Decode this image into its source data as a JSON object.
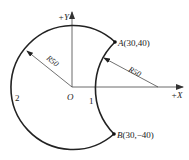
{
  "diagram": {
    "type": "arc-path",
    "axes": {
      "x_label": "+X",
      "y_label": "+Y",
      "origin_label": "O"
    },
    "points": {
      "A": {
        "label": "A(30,40)",
        "x": 30,
        "y": 40
      },
      "B": {
        "label": "B(30,−40)",
        "x": 30,
        "y": -40
      }
    },
    "arcs": [
      {
        "id": "1",
        "label": "1",
        "radius_label": "R50",
        "from": "A",
        "to": "B",
        "direction": "concave-inner"
      },
      {
        "id": "2",
        "label": "2",
        "radius_label": "R50",
        "from": "A",
        "to": "B",
        "direction": "outer-ccw"
      }
    ],
    "colors": {
      "stroke": "#222222",
      "axis": "#444444",
      "background": "#ffffff"
    }
  }
}
